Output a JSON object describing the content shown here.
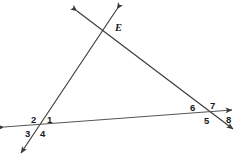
{
  "figure": {
    "type": "geometry-diagram",
    "background_color": "#ffffff",
    "stroke_color": "#3a3a3a",
    "label_color": "#1a1a1a"
  },
  "points": [
    {
      "name": "E",
      "label": "E",
      "x": 115,
      "y": 28
    }
  ],
  "angle_labels": [
    {
      "id": "angle-1",
      "label": "1",
      "x": 47,
      "y": 115
    },
    {
      "id": "angle-2",
      "label": "2",
      "x": 31,
      "y": 115
    },
    {
      "id": "angle-3",
      "label": "3",
      "x": 25,
      "y": 129
    },
    {
      "id": "angle-4",
      "label": "4",
      "x": 40,
      "y": 129
    },
    {
      "id": "angle-5",
      "label": "5",
      "x": 204,
      "y": 116
    },
    {
      "id": "angle-6",
      "label": "6",
      "x": 190,
      "y": 103
    },
    {
      "id": "angle-7",
      "label": "7",
      "x": 210,
      "y": 101
    },
    {
      "id": "angle-8",
      "label": "8",
      "x": 226,
      "y": 115
    }
  ],
  "lines": [
    {
      "id": "left-transversal",
      "from": {
        "x": 117,
        "y": 9
      },
      "to": {
        "x": 21,
        "y": 153
      },
      "arrows": "both"
    },
    {
      "id": "right-transversal",
      "from": {
        "x": 77,
        "y": 11
      },
      "to": {
        "x": 233,
        "y": 129
      },
      "arrows": "both"
    },
    {
      "id": "horizontal-line",
      "from": {
        "x": 4,
        "y": 127
      },
      "to": {
        "x": 232,
        "y": 110
      },
      "arrows": "both"
    }
  ]
}
